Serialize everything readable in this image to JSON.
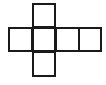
{
  "diagram": {
    "type": "cube-net",
    "stroke_color": "#1a1a1a",
    "background": "#ffffff",
    "faces": [
      {
        "id": "top",
        "x": 32,
        "y": 3,
        "w": 24,
        "h": 25
      },
      {
        "id": "left",
        "x": 8,
        "y": 27,
        "w": 25,
        "h": 25
      },
      {
        "id": "center",
        "x": 32,
        "y": 27,
        "w": 24,
        "h": 25
      },
      {
        "id": "right",
        "x": 55,
        "y": 27,
        "w": 25,
        "h": 25
      },
      {
        "id": "far-right",
        "x": 78,
        "y": 27,
        "w": 24,
        "h": 25
      },
      {
        "id": "bottom",
        "x": 32,
        "y": 51,
        "w": 24,
        "h": 26
      }
    ]
  }
}
